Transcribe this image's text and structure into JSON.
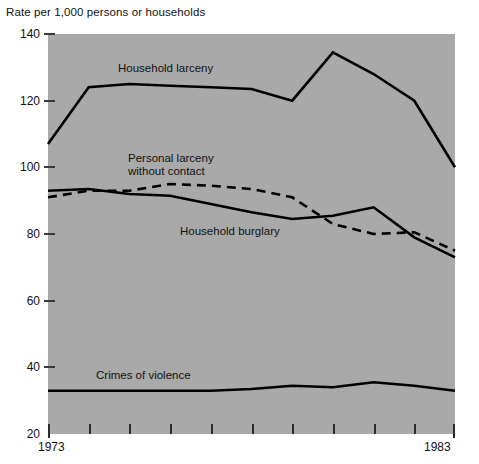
{
  "chart_data": {
    "type": "line",
    "title": "Rate per 1,000 persons or households",
    "xlabel": "",
    "ylabel": "Rate per 1,000 persons or households",
    "x": [
      1973,
      1974,
      1975,
      1976,
      1977,
      1978,
      1979,
      1980,
      1981,
      1982,
      1983
    ],
    "xlim": [
      1973,
      1983
    ],
    "ylim": [
      20,
      140
    ],
    "yticks": [
      20,
      40,
      60,
      80,
      100,
      120,
      140
    ],
    "xticks": [
      1973,
      1974,
      1975,
      1976,
      1977,
      1978,
      1979,
      1980,
      1981,
      1982,
      1983
    ],
    "xtick_labels_shown": [
      "1973",
      "1983"
    ],
    "grid": false,
    "legend": "inline-annotations",
    "background": "#a9a9a9",
    "series": [
      {
        "name": "Household larceny",
        "style": "solid",
        "values": [
          107,
          124,
          125,
          124.5,
          124,
          123.5,
          120,
          134.5,
          128,
          120,
          100
        ]
      },
      {
        "name": "Personal larceny without contact",
        "style": "dashed",
        "values": [
          91,
          93,
          93,
          95,
          94.5,
          93.5,
          91,
          83,
          80,
          80.5,
          75
        ]
      },
      {
        "name": "Household burglary",
        "style": "solid",
        "values": [
          93,
          93.5,
          92,
          91.5,
          89,
          86.5,
          84.5,
          85.5,
          88,
          79,
          73
        ]
      },
      {
        "name": "Crimes of violence",
        "style": "solid",
        "values": [
          33,
          33,
          33,
          33,
          33,
          33.5,
          34.5,
          34,
          35.5,
          34.5,
          33
        ]
      }
    ],
    "annotations": [
      {
        "text": "Household larceny",
        "x": 1975.3,
        "y": 129
      },
      {
        "text": "Personal larceny",
        "x": 1974.3,
        "y": 104.5
      },
      {
        "text": "without contact",
        "x": 1974.3,
        "y": 100.7
      },
      {
        "text": "Household burglary",
        "x": 1977.3,
        "y": 84.5
      },
      {
        "text": "Crimes of violence",
        "x": 1974.5,
        "y": 38.5
      }
    ]
  },
  "axis": {
    "title": "Rate per 1,000 persons or households",
    "y_labels": [
      "140",
      "120",
      "100",
      "80",
      "60",
      "40",
      "20"
    ],
    "x_start_label": "1973",
    "x_end_label": "1983"
  },
  "labels": {
    "household_larceny": "Household larceny",
    "personal_larceny_line1": "Personal larceny",
    "personal_larceny_line2": "without contact",
    "household_burglary": "Household burglary",
    "crimes_of_violence": "Crimes of violence"
  },
  "colors": {
    "plot_background": "#a9a9a9",
    "line": "#000000",
    "page_background": "#ffffff",
    "text": "#111111"
  }
}
